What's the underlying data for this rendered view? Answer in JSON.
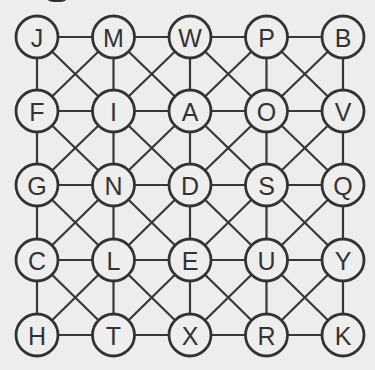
{
  "diagram": {
    "type": "letter-grid-graph",
    "rows": 5,
    "cols": 5,
    "connectivity": "king-moves (horizontal, vertical, both diagonals between adjacent cells)",
    "grid": [
      [
        "J",
        "M",
        "W",
        "P",
        "B"
      ],
      [
        "F",
        "I",
        "A",
        "O",
        "V"
      ],
      [
        "G",
        "N",
        "D",
        "S",
        "Q"
      ],
      [
        "C",
        "L",
        "E",
        "U",
        "Y"
      ],
      [
        "H",
        "T",
        "X",
        "R",
        "K"
      ]
    ],
    "layout": {
      "col_x": [
        37,
        113.5,
        190,
        266.5,
        343
      ],
      "row_y": [
        37,
        111,
        185,
        260,
        335
      ],
      "node_radius": 21
    },
    "colors": {
      "background": "#ededed",
      "line": "#383838",
      "circle_stroke": "#333333",
      "circle_fill": "#eeeeee",
      "text": "#333333"
    }
  }
}
